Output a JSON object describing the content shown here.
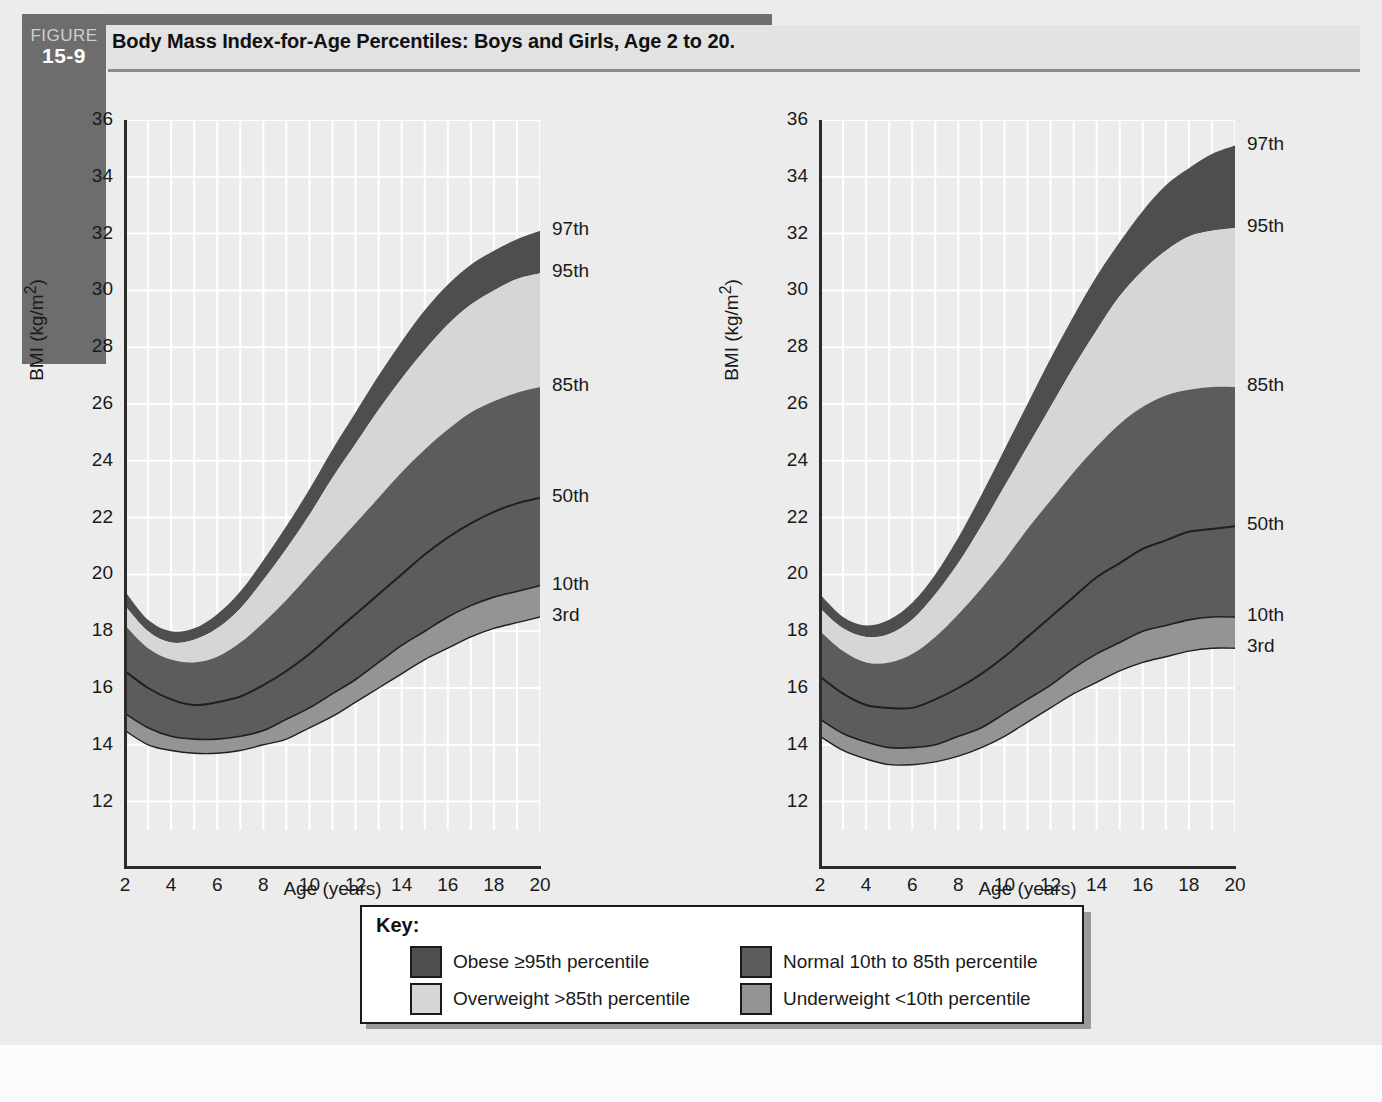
{
  "figure": {
    "badge_word": "FIGURE",
    "badge_number": "15-9",
    "title": "Body Mass Index-for-Age Percentiles: Boys and Girls, Age 2 to 20."
  },
  "key": {
    "title": "Key:",
    "entries": [
      {
        "label": "Obese ≥95th percentile",
        "color": "#4e4e4e"
      },
      {
        "label": "Normal 10th to 85th percentile",
        "color": "#5c5c5c"
      },
      {
        "label": "Overweight >85th percentile",
        "color": "#d6d6d6"
      },
      {
        "label": "Underweight <10th percentile",
        "color": "#949494"
      }
    ]
  },
  "colors": {
    "obese": "#4e4e4e",
    "overweight": "#d6d6d6",
    "normal": "#5c5c5c",
    "underweight": "#949494",
    "plot_bg": "#ececec",
    "gridline": "#ffffff",
    "axis": "#2b2b2b",
    "page_bg": "#ececec"
  },
  "chart_data": [
    {
      "id": "boys",
      "type": "area",
      "title": "Body mass index-for-age percentiles:\nBoys, 2 to 20 years",
      "xlabel": "Age (years)",
      "ylabel": "BMI (kg/m²)",
      "xlim": [
        2,
        20
      ],
      "ylim": [
        11,
        36
      ],
      "xticks": [
        2,
        4,
        6,
        8,
        10,
        12,
        14,
        16,
        18,
        20
      ],
      "yticks": [
        12,
        14,
        16,
        18,
        20,
        22,
        24,
        26,
        28,
        30,
        32,
        34,
        36
      ],
      "grid": true,
      "x": [
        2,
        3,
        4,
        5,
        6,
        7,
        8,
        9,
        10,
        11,
        12,
        13,
        14,
        15,
        16,
        17,
        18,
        19,
        20
      ],
      "series": [
        {
          "name": "97th",
          "end_label": "97th",
          "values": [
            19.4,
            18.4,
            18.0,
            18.1,
            18.6,
            19.4,
            20.5,
            21.7,
            23.0,
            24.4,
            25.7,
            27.0,
            28.2,
            29.3,
            30.2,
            30.9,
            31.4,
            31.8,
            32.1
          ]
        },
        {
          "name": "95th",
          "end_label": "95th",
          "values": [
            18.9,
            18.0,
            17.6,
            17.7,
            18.1,
            18.8,
            19.8,
            20.9,
            22.1,
            23.4,
            24.6,
            25.8,
            26.9,
            27.9,
            28.8,
            29.5,
            30.0,
            30.4,
            30.6
          ]
        },
        {
          "name": "85th",
          "end_label": "85th",
          "values": [
            18.2,
            17.4,
            17.0,
            16.9,
            17.1,
            17.6,
            18.3,
            19.1,
            20.0,
            20.9,
            21.8,
            22.7,
            23.6,
            24.4,
            25.1,
            25.7,
            26.1,
            26.4,
            26.6
          ]
        },
        {
          "name": "50th",
          "end_label": "50th",
          "values": [
            16.6,
            16.0,
            15.6,
            15.4,
            15.5,
            15.7,
            16.1,
            16.6,
            17.2,
            17.9,
            18.6,
            19.3,
            20.0,
            20.7,
            21.3,
            21.8,
            22.2,
            22.5,
            22.7
          ]
        },
        {
          "name": "10th",
          "end_label": "10th",
          "values": [
            15.1,
            14.6,
            14.3,
            14.2,
            14.2,
            14.3,
            14.5,
            14.9,
            15.3,
            15.8,
            16.3,
            16.9,
            17.5,
            18.0,
            18.5,
            18.9,
            19.2,
            19.4,
            19.6
          ]
        },
        {
          "name": "3rd",
          "end_label": "3rd",
          "values": [
            14.5,
            14.0,
            13.8,
            13.7,
            13.7,
            13.8,
            14.0,
            14.2,
            14.6,
            15.0,
            15.5,
            16.0,
            16.5,
            17.0,
            17.4,
            17.8,
            18.1,
            18.3,
            18.5
          ]
        }
      ],
      "bands": [
        {
          "name": "obese",
          "upper": "97th",
          "lower": "95th",
          "color": "#4e4e4e"
        },
        {
          "name": "overweight",
          "upper": "95th",
          "lower": "85th",
          "color": "#d6d6d6"
        },
        {
          "name": "normal",
          "upper": "85th",
          "lower": "10th",
          "color": "#5c5c5c"
        },
        {
          "name": "underweight",
          "upper": "10th",
          "lower": "3rd",
          "color": "#949494"
        }
      ]
    },
    {
      "id": "girls",
      "type": "area",
      "title": "Body mass index-for-age percentiles:\nGirls, 2 to 20 years",
      "xlabel": "Age (years)",
      "ylabel": "BMI (kg/m²)",
      "xlim": [
        2,
        20
      ],
      "ylim": [
        11,
        36
      ],
      "xticks": [
        2,
        4,
        6,
        8,
        10,
        12,
        14,
        16,
        18,
        20
      ],
      "yticks": [
        12,
        14,
        16,
        18,
        20,
        22,
        24,
        26,
        28,
        30,
        32,
        34,
        36
      ],
      "grid": true,
      "x": [
        2,
        3,
        4,
        5,
        6,
        7,
        8,
        9,
        10,
        11,
        12,
        13,
        14,
        15,
        16,
        17,
        18,
        19,
        20
      ],
      "series": [
        {
          "name": "97th",
          "end_label": "97th",
          "values": [
            19.3,
            18.5,
            18.2,
            18.4,
            19.0,
            20.0,
            21.3,
            22.8,
            24.4,
            26.0,
            27.6,
            29.1,
            30.5,
            31.7,
            32.8,
            33.7,
            34.3,
            34.8,
            35.1
          ]
        },
        {
          "name": "95th",
          "end_label": "95th",
          "values": [
            18.8,
            18.1,
            17.8,
            17.9,
            18.4,
            19.3,
            20.4,
            21.7,
            23.1,
            24.5,
            25.9,
            27.3,
            28.6,
            29.8,
            30.7,
            31.4,
            31.9,
            32.1,
            32.2
          ]
        },
        {
          "name": "85th",
          "end_label": "85th",
          "values": [
            18.0,
            17.3,
            16.9,
            16.9,
            17.2,
            17.8,
            18.6,
            19.5,
            20.5,
            21.6,
            22.6,
            23.6,
            24.5,
            25.3,
            25.9,
            26.3,
            26.5,
            26.6,
            26.6
          ]
        },
        {
          "name": "50th",
          "end_label": "50th",
          "values": [
            16.4,
            15.8,
            15.4,
            15.3,
            15.3,
            15.6,
            16.0,
            16.5,
            17.1,
            17.8,
            18.5,
            19.2,
            19.9,
            20.4,
            20.9,
            21.2,
            21.5,
            21.6,
            21.7
          ]
        },
        {
          "name": "10th",
          "end_label": "10th",
          "values": [
            14.9,
            14.4,
            14.1,
            13.9,
            13.9,
            14.0,
            14.3,
            14.6,
            15.1,
            15.6,
            16.1,
            16.7,
            17.2,
            17.6,
            18.0,
            18.2,
            18.4,
            18.5,
            18.5
          ]
        },
        {
          "name": "3rd",
          "end_label": "3rd",
          "values": [
            14.3,
            13.8,
            13.5,
            13.3,
            13.3,
            13.4,
            13.6,
            13.9,
            14.3,
            14.8,
            15.3,
            15.8,
            16.2,
            16.6,
            16.9,
            17.1,
            17.3,
            17.4,
            17.4
          ]
        }
      ],
      "bands": [
        {
          "name": "obese",
          "upper": "97th",
          "lower": "95th",
          "color": "#4e4e4e"
        },
        {
          "name": "overweight",
          "upper": "95th",
          "lower": "85th",
          "color": "#d6d6d6"
        },
        {
          "name": "normal",
          "upper": "85th",
          "lower": "10th",
          "color": "#5c5c5c"
        },
        {
          "name": "underweight",
          "upper": "10th",
          "lower": "3rd",
          "color": "#949494"
        }
      ]
    }
  ]
}
